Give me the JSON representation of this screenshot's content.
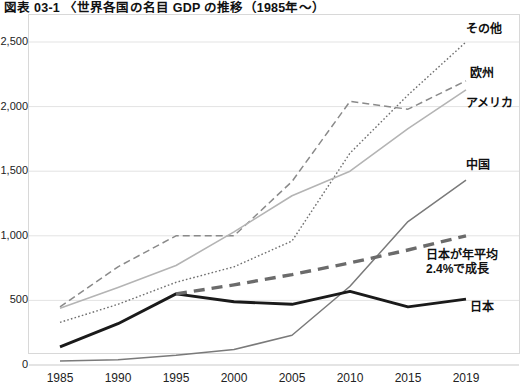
{
  "figure": {
    "title": "図表 03-1 〈世界各国の名目 GDP の推移（1985年～）"
  },
  "axes": {
    "y_ticks": [
      "2,500",
      "2,000",
      "1,500",
      "1,000",
      "500",
      "0"
    ],
    "y_values": [
      2500,
      2000,
      1500,
      1000,
      500,
      0
    ],
    "x_ticks": [
      "1985",
      "1990",
      "1995",
      "2000",
      "2005",
      "2010",
      "2015",
      "2019"
    ]
  },
  "series_labels": {
    "other": "その他",
    "europe": "欧州",
    "america": "アメリカ",
    "china": "中国",
    "japan": "日本",
    "annotation_line1": "日本が年平均",
    "annotation_line2": "2.4%で成長"
  },
  "colors": {
    "other": "#6f6f6f",
    "europe": "#8a8a8a",
    "america": "#b4b4b4",
    "china": "#7a7a7a",
    "japan": "#1a1a1a",
    "trend": "#6b6b6b",
    "grid": "#e3e3e3",
    "frame": "#d8d8d8"
  },
  "chart_data": {
    "type": "line",
    "title": "図表 03-1 〈世界各国の名目 GDP の推移（1985年～）",
    "xlabel": "",
    "ylabel": "",
    "ylim": [
      0,
      2500
    ],
    "grid": true,
    "legend_position": "right-inline-labels",
    "categories": [
      "1985",
      "1990",
      "1995",
      "2000",
      "2005",
      "2010",
      "2015",
      "2019"
    ],
    "x": [
      1985,
      1990,
      1995,
      2000,
      2005,
      2010,
      2015,
      2019
    ],
    "series": [
      {
        "name": "その他",
        "style": "dotted",
        "values": [
          330,
          470,
          640,
          760,
          960,
          1640,
          2090,
          2500
        ]
      },
      {
        "name": "欧州",
        "style": "dashed",
        "values": [
          450,
          760,
          1000,
          1000,
          1420,
          2040,
          1980,
          2200
        ]
      },
      {
        "name": "アメリカ",
        "style": "solid-light",
        "values": [
          440,
          600,
          770,
          1030,
          1310,
          1500,
          1830,
          2130
        ]
      },
      {
        "name": "中国",
        "style": "solid-medium",
        "values": [
          30,
          40,
          75,
          120,
          230,
          610,
          1110,
          1430
        ]
      },
      {
        "name": "日本",
        "style": "solid-bold",
        "values": [
          140,
          320,
          550,
          490,
          470,
          570,
          450,
          510
        ]
      },
      {
        "name": "日本が年平均2.4%で成長",
        "style": "thick-dashed",
        "values": [
          null,
          null,
          550,
          620,
          700,
          790,
          890,
          1000
        ]
      }
    ],
    "annotations": [
      {
        "text": "日本が年平均 2.4%で成長",
        "x": 2015,
        "y": 760
      }
    ]
  }
}
